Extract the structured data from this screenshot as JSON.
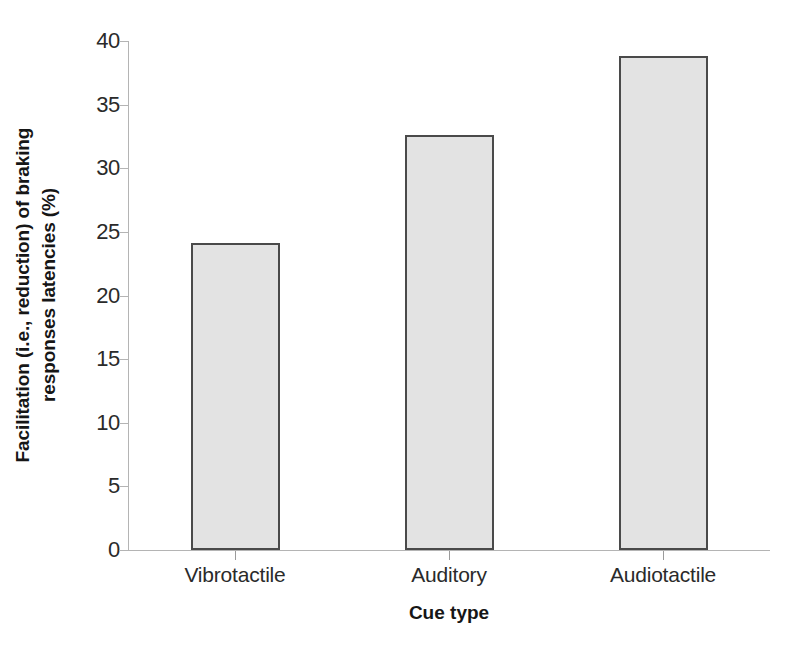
{
  "chart_data": {
    "type": "bar",
    "title": "",
    "subtitle": "",
    "categories": [
      "Vibrotactile",
      "Auditory",
      "Audiotactile"
    ],
    "values": [
      24.1,
      32.6,
      38.8
    ],
    "xlabel": "Cue type",
    "ylabel": "Facilitation (i.e., reduction) of braking responses latencies (%)",
    "ylabel_line1": "Facilitation (i.e., reduction) of braking",
    "ylabel_line2": "responses latencies (%)",
    "ylim": [
      0,
      40
    ],
    "ytick_values": [
      0,
      5,
      10,
      15,
      20,
      25,
      30,
      35,
      40
    ],
    "ytick_labels": [
      "0",
      "5",
      "10",
      "15",
      "20",
      "25",
      "30",
      "35",
      "40"
    ],
    "grid": false,
    "legend": null,
    "series": [
      {
        "name": "Facilitation",
        "values": [
          24.1,
          32.6,
          38.8
        ],
        "bar_fill_color": "#e3e3e3",
        "bar_border_color": "#4a4a4a"
      }
    ],
    "axis_color": "#b4b4b4"
  },
  "page": {
    "bottom_cut_text": ""
  }
}
